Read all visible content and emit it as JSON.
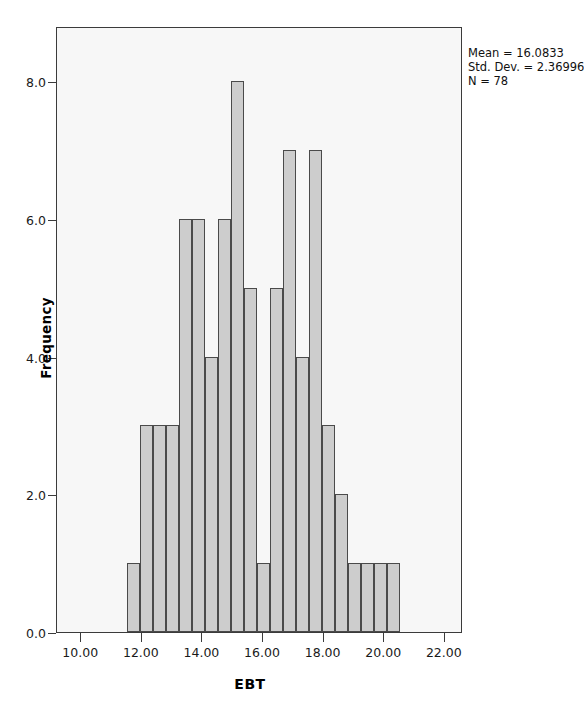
{
  "chart_data": {
    "type": "bar",
    "title": "",
    "subtitle": "",
    "xlabel": "EBT",
    "ylabel": "Frequency",
    "xlim": [
      9.2,
      22.6
    ],
    "ylim": [
      0,
      8.8
    ],
    "grid": false,
    "legend_position": "none",
    "bin_width": 0.43,
    "x_ticks": [
      "10.00",
      "12.00",
      "14.00",
      "16.00",
      "18.00",
      "20.00",
      "22.00"
    ],
    "x_tick_values": [
      10,
      12,
      14,
      16,
      18,
      20,
      22
    ],
    "y_ticks": [
      "0.0",
      "2.0",
      "4.0",
      "6.0",
      "8.0"
    ],
    "y_tick_values": [
      0,
      2,
      4,
      6,
      8
    ],
    "bin_starts": [
      11.5,
      11.93,
      12.36,
      12.79,
      13.22,
      13.65,
      14.08,
      14.51,
      14.94,
      15.37,
      15.8,
      16.23,
      16.66,
      17.09,
      17.52,
      17.95,
      18.38,
      18.81,
      19.24,
      19.67,
      20.1,
      20.53,
      20.96,
      21.39
    ],
    "bin_centers": [
      11.72,
      12.15,
      12.58,
      13.01,
      13.44,
      13.87,
      14.3,
      14.73,
      15.16,
      15.59,
      16.02,
      16.45,
      16.88,
      17.31,
      17.74,
      18.17,
      18.6,
      19.03,
      19.46,
      19.89,
      20.32,
      20.75,
      21.18,
      21.61
    ],
    "values": [
      1,
      3,
      3,
      3,
      6,
      6,
      4,
      6,
      8,
      5,
      1,
      5,
      7,
      4,
      7,
      3,
      2,
      1,
      1,
      1,
      1,
      0,
      0,
      0
    ],
    "bars": [
      {
        "center": 11.72,
        "value": 1
      },
      {
        "center": 12.15,
        "value": 3
      },
      {
        "center": 12.58,
        "value": 3
      },
      {
        "center": 13.01,
        "value": 3
      },
      {
        "center": 13.44,
        "value": 6
      },
      {
        "center": 13.87,
        "value": 6
      },
      {
        "center": 14.3,
        "value": 4
      },
      {
        "center": 14.73,
        "value": 6
      },
      {
        "center": 15.16,
        "value": 8
      },
      {
        "center": 15.59,
        "value": 5
      },
      {
        "center": 16.02,
        "value": 1
      },
      {
        "center": 16.45,
        "value": 5
      },
      {
        "center": 16.88,
        "value": 7
      },
      {
        "center": 17.31,
        "value": 4
      },
      {
        "center": 17.74,
        "value": 7
      },
      {
        "center": 18.17,
        "value": 3
      },
      {
        "center": 18.6,
        "value": 2
      },
      {
        "center": 19.03,
        "value": 1
      },
      {
        "center": 19.46,
        "value": 1
      },
      {
        "center": 19.89,
        "value": 1
      },
      {
        "center": 20.32,
        "value": 1
      }
    ]
  },
  "stats": {
    "mean_label": "Mean = 16.0833",
    "std_label": "Std. Dev. = 2.36996",
    "n_label": "N = 78",
    "mean": 16.0833,
    "std_dev": 2.36996,
    "n": 78
  },
  "axes": {
    "x_title": "EBT",
    "y_title": "Frequency"
  },
  "colors": {
    "bar_fill": "#cdcdcd",
    "bar_border": "#4a4a4a",
    "plot_background": "#f7f7f7",
    "frame": "#3b3b3b",
    "text": "#111111"
  }
}
